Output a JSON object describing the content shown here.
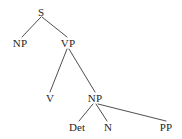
{
  "diagram": {
    "kind": "syntax-tree",
    "background_color": "#ffffff",
    "line_color": "#3a3a3a",
    "text_color": "#262626",
    "nodes": [
      {
        "id": "s",
        "label": "S",
        "x": 41,
        "y": 12,
        "level": 0
      },
      {
        "id": "np1",
        "label": "NP",
        "x": 20,
        "y": 43,
        "level": 1
      },
      {
        "id": "vp",
        "label": "VP",
        "x": 68,
        "y": 43,
        "level": 1
      },
      {
        "id": "v",
        "label": "V",
        "x": 50,
        "y": 98,
        "level": 2
      },
      {
        "id": "np2",
        "label": "NP",
        "x": 95,
        "y": 98,
        "level": 2
      },
      {
        "id": "det",
        "label": "Det",
        "x": 77,
        "y": 127,
        "level": 3
      },
      {
        "id": "n",
        "label": "N",
        "x": 108,
        "y": 127,
        "level": 3
      },
      {
        "id": "pp",
        "label": "PP",
        "x": 166,
        "y": 127,
        "level": 3
      }
    ],
    "edges": [
      {
        "from": "s",
        "to": "np1",
        "x1": 41,
        "y1": 17,
        "x2": 22,
        "y2": 37
      },
      {
        "from": "s",
        "to": "vp",
        "x1": 42,
        "y1": 17,
        "x2": 67,
        "y2": 37
      },
      {
        "from": "vp",
        "to": "v",
        "x1": 67,
        "y1": 49,
        "x2": 50,
        "y2": 92
      },
      {
        "from": "vp",
        "to": "np2",
        "x1": 69,
        "y1": 49,
        "x2": 95,
        "y2": 92
      },
      {
        "from": "np2",
        "to": "det",
        "x1": 93,
        "y1": 104,
        "x2": 79,
        "y2": 121
      },
      {
        "from": "np2",
        "to": "n",
        "x1": 96,
        "y1": 104,
        "x2": 107,
        "y2": 121
      },
      {
        "from": "np2",
        "to": "pp",
        "x1": 98,
        "y1": 104,
        "x2": 166,
        "y2": 121
      }
    ]
  }
}
